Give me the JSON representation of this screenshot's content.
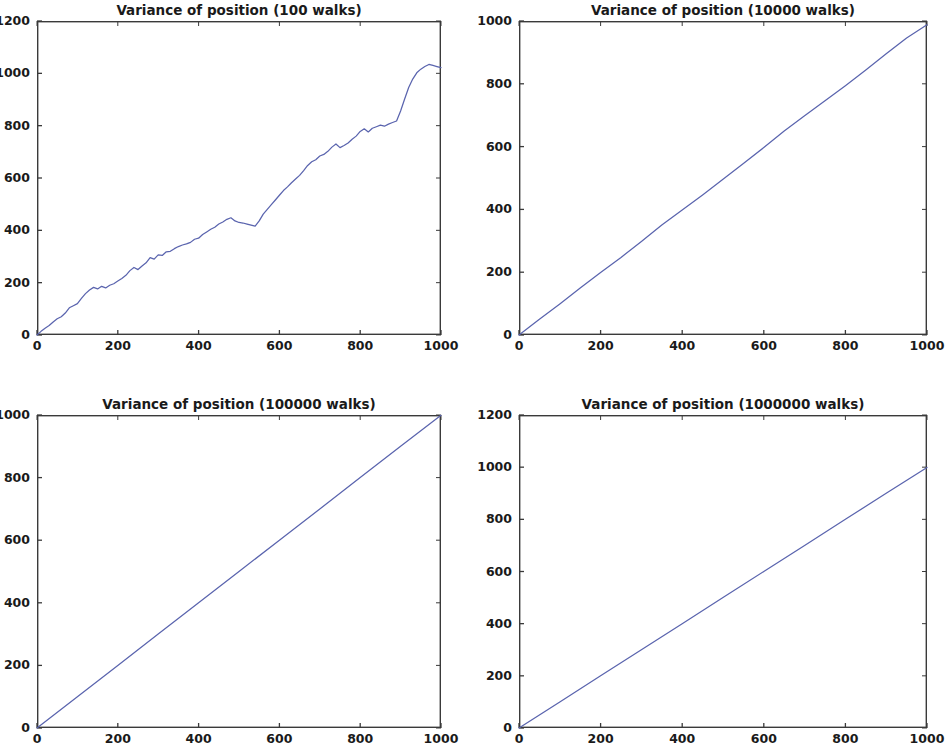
{
  "figure": {
    "name": "random-walk-variance-figure",
    "width": 950,
    "height": 748,
    "background": "#ffffff",
    "line_color": "#5a64ae",
    "axis_color": "#3a3a3a",
    "text_color": "#1a1a1a",
    "rows": 2,
    "cols": 2
  },
  "chart_data": [
    {
      "id": "variance-100-walks",
      "type": "line",
      "title": "Variance of position (100 walks)",
      "xlabel": "",
      "ylabel": "",
      "xlim": [
        0,
        1000
      ],
      "ylim": [
        0,
        1200
      ],
      "xticks": [
        0,
        200,
        400,
        600,
        800,
        1000
      ],
      "yticks": [
        0,
        200,
        400,
        600,
        800,
        1000,
        1200
      ],
      "xticklabels": [
        "0",
        "200",
        "400",
        "600",
        "800",
        "1000"
      ],
      "yticklabels": [
        "0",
        "200",
        "400",
        "600",
        "800",
        "1000",
        "1200"
      ],
      "grid": false,
      "legend": null,
      "series": [
        {
          "name": "variance",
          "color": "#5a64ae",
          "x": [
            0,
            10,
            20,
            30,
            40,
            50,
            60,
            70,
            80,
            90,
            100,
            110,
            120,
            130,
            140,
            150,
            160,
            170,
            180,
            190,
            200,
            210,
            220,
            230,
            240,
            250,
            260,
            270,
            280,
            290,
            300,
            310,
            320,
            330,
            340,
            350,
            360,
            370,
            380,
            390,
            400,
            410,
            420,
            430,
            440,
            450,
            460,
            470,
            480,
            490,
            500,
            510,
            520,
            530,
            540,
            550,
            560,
            570,
            580,
            590,
            600,
            610,
            620,
            630,
            640,
            650,
            660,
            670,
            680,
            690,
            700,
            710,
            720,
            730,
            740,
            750,
            760,
            770,
            780,
            790,
            800,
            810,
            820,
            830,
            840,
            850,
            860,
            870,
            880,
            890,
            900,
            910,
            920,
            930,
            940,
            950,
            960,
            970,
            980,
            990,
            1000
          ],
          "y": [
            0,
            14,
            26,
            36,
            50,
            62,
            70,
            84,
            104,
            112,
            120,
            140,
            158,
            172,
            182,
            176,
            186,
            180,
            190,
            196,
            206,
            216,
            228,
            246,
            258,
            250,
            264,
            276,
            296,
            290,
            306,
            304,
            318,
            320,
            330,
            338,
            344,
            348,
            354,
            366,
            370,
            384,
            394,
            404,
            412,
            424,
            432,
            442,
            448,
            436,
            430,
            428,
            424,
            420,
            416,
            436,
            462,
            480,
            498,
            516,
            534,
            552,
            566,
            582,
            596,
            610,
            628,
            648,
            662,
            670,
            684,
            690,
            702,
            718,
            730,
            716,
            724,
            734,
            748,
            760,
            778,
            788,
            776,
            790,
            796,
            802,
            798,
            806,
            812,
            818,
            856,
            902,
            946,
            978,
            1002,
            1016,
            1026,
            1034,
            1030,
            1026,
            1022
          ]
        }
      ]
    },
    {
      "id": "variance-10000-walks",
      "type": "line",
      "title": "Variance of position (10000 walks)",
      "xlabel": "",
      "ylabel": "",
      "xlim": [
        0,
        1000
      ],
      "ylim": [
        0,
        1000
      ],
      "xticks": [
        0,
        200,
        400,
        600,
        800,
        1000
      ],
      "yticks": [
        0,
        200,
        400,
        600,
        800,
        1000
      ],
      "xticklabels": [
        "0",
        "200",
        "400",
        "600",
        "800",
        "1000"
      ],
      "yticklabels": [
        "0",
        "200",
        "400",
        "600",
        "800",
        "1000"
      ],
      "grid": false,
      "legend": null,
      "series": [
        {
          "name": "variance",
          "color": "#5a64ae",
          "x": [
            0,
            50,
            100,
            150,
            200,
            250,
            300,
            350,
            400,
            450,
            500,
            550,
            600,
            650,
            700,
            750,
            800,
            850,
            900,
            950,
            1000
          ],
          "y": [
            0,
            50,
            99,
            150,
            199,
            247,
            298,
            350,
            398,
            446,
            496,
            546,
            597,
            650,
            698,
            746,
            794,
            844,
            896,
            946,
            988
          ]
        }
      ]
    },
    {
      "id": "variance-100000-walks",
      "type": "line",
      "title": "Variance of position (100000 walks)",
      "xlabel": "",
      "ylabel": "",
      "xlim": [
        0,
        1000
      ],
      "ylim": [
        0,
        1000
      ],
      "xticks": [
        0,
        200,
        400,
        600,
        800,
        1000
      ],
      "yticks": [
        0,
        200,
        400,
        600,
        800,
        1000
      ],
      "xticklabels": [
        "0",
        "200",
        "400",
        "600",
        "800",
        "1000"
      ],
      "yticklabels": [
        "0",
        "200",
        "400",
        "600",
        "800",
        "1000"
      ],
      "grid": false,
      "legend": null,
      "series": [
        {
          "name": "variance",
          "color": "#5a64ae",
          "x": [
            0,
            100,
            200,
            300,
            400,
            500,
            600,
            700,
            800,
            900,
            1000
          ],
          "y": [
            0,
            100,
            200,
            300,
            400,
            500,
            600,
            700,
            800,
            900,
            999
          ]
        }
      ]
    },
    {
      "id": "variance-1000000-walks",
      "type": "line",
      "title": "Variance of position (1000000 walks)",
      "xlabel": "",
      "ylabel": "",
      "xlim": [
        0,
        1000
      ],
      "ylim": [
        0,
        1200
      ],
      "xticks": [
        0,
        200,
        400,
        600,
        800,
        1000
      ],
      "yticks": [
        0,
        200,
        400,
        600,
        800,
        1000,
        1200
      ],
      "xticklabels": [
        "0",
        "200",
        "400",
        "600",
        "800",
        "1000"
      ],
      "yticklabels": [
        "0",
        "200",
        "400",
        "600",
        "800",
        "1000",
        "1200"
      ],
      "grid": false,
      "legend": null,
      "series": [
        {
          "name": "variance",
          "color": "#5a64ae",
          "x": [
            0,
            100,
            200,
            300,
            400,
            500,
            600,
            700,
            800,
            900,
            1000
          ],
          "y": [
            0,
            100,
            200,
            300,
            400,
            500,
            600,
            700,
            800,
            900,
            999
          ]
        }
      ]
    }
  ],
  "layout": {
    "panels": [
      {
        "chart_index": 0,
        "left": 37,
        "top": 21,
        "width": 404,
        "height": 314
      },
      {
        "chart_index": 1,
        "left": 519,
        "top": 21,
        "width": 408,
        "height": 314
      },
      {
        "chart_index": 2,
        "left": 37,
        "top": 415,
        "width": 404,
        "height": 313
      },
      {
        "chart_index": 3,
        "left": 519,
        "top": 415,
        "width": 408,
        "height": 313
      }
    ]
  }
}
